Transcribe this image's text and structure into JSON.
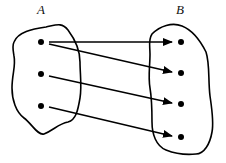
{
  "diagram": {
    "type": "mapping",
    "sets": [
      {
        "id": "A",
        "label": "A",
        "elements": [
          "a1",
          "a2",
          "a3"
        ]
      },
      {
        "id": "B",
        "label": "B",
        "elements": [
          "b1",
          "b2",
          "b3",
          "b4"
        ]
      }
    ],
    "arrows": [
      {
        "from": "a1",
        "to": "b1"
      },
      {
        "from": "a1",
        "to": "b2"
      },
      {
        "from": "a2",
        "to": "b3"
      },
      {
        "from": "a3",
        "to": "b4"
      }
    ],
    "colors": {
      "stroke": "#000000",
      "background": "#ffffff"
    }
  }
}
